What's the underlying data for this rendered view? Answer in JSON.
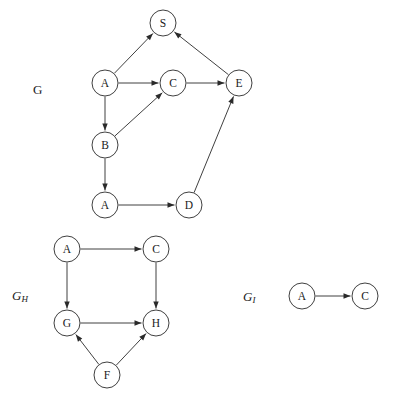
{
  "figure": {
    "type": "directed-graph-collection",
    "background_color": "#ffffff",
    "stroke_color": "#2a2a2a",
    "node_fill": "#ffffff",
    "node_radius": 13
  },
  "graphs": [
    {
      "id": "G",
      "label": "G",
      "label_base": "G",
      "label_sub": "",
      "label_pos": {
        "x": 33,
        "y": 82
      },
      "nodes": [
        {
          "id": "S",
          "label": "S",
          "x": 163,
          "y": 23
        },
        {
          "id": "A1",
          "label": "A",
          "x": 105,
          "y": 83
        },
        {
          "id": "C",
          "label": "C",
          "x": 173,
          "y": 83
        },
        {
          "id": "E",
          "label": "E",
          "x": 239,
          "y": 83
        },
        {
          "id": "B",
          "label": "B",
          "x": 105,
          "y": 145
        },
        {
          "id": "A2",
          "label": "A",
          "x": 105,
          "y": 205
        },
        {
          "id": "D",
          "label": "D",
          "x": 189,
          "y": 205
        }
      ],
      "edges": [
        {
          "from": "A1",
          "to": "S",
          "directed": true
        },
        {
          "from": "A1",
          "to": "C",
          "directed": true
        },
        {
          "from": "C",
          "to": "E",
          "directed": true
        },
        {
          "from": "E",
          "to": "S",
          "directed": true
        },
        {
          "from": "A1",
          "to": "B",
          "directed": true
        },
        {
          "from": "B",
          "to": "C",
          "directed": true
        },
        {
          "from": "B",
          "to": "A2",
          "directed": true
        },
        {
          "from": "A2",
          "to": "D",
          "directed": true
        },
        {
          "from": "D",
          "to": "E",
          "directed": true
        }
      ]
    },
    {
      "id": "GH",
      "label": "GH",
      "label_base": "G",
      "label_sub": "H",
      "label_pos": {
        "x": 12,
        "y": 288
      },
      "nodes": [
        {
          "id": "A",
          "label": "A",
          "x": 67,
          "y": 249
        },
        {
          "id": "C",
          "label": "C",
          "x": 156,
          "y": 249
        },
        {
          "id": "G",
          "label": "G",
          "x": 67,
          "y": 323
        },
        {
          "id": "H",
          "label": "H",
          "x": 156,
          "y": 323
        },
        {
          "id": "F",
          "label": "F",
          "x": 107,
          "y": 375
        }
      ],
      "edges": [
        {
          "from": "A",
          "to": "C",
          "directed": true
        },
        {
          "from": "A",
          "to": "G",
          "directed": true
        },
        {
          "from": "C",
          "to": "H",
          "directed": true
        },
        {
          "from": "G",
          "to": "H",
          "directed": true
        },
        {
          "from": "F",
          "to": "G",
          "directed": true
        },
        {
          "from": "F",
          "to": "H",
          "directed": true
        }
      ]
    },
    {
      "id": "GI",
      "label": "GI",
      "label_base": "G",
      "label_sub": "I",
      "label_pos": {
        "x": 243,
        "y": 289
      },
      "nodes": [
        {
          "id": "A",
          "label": "A",
          "x": 302,
          "y": 296
        },
        {
          "id": "C",
          "label": "C",
          "x": 365,
          "y": 296
        }
      ],
      "edges": [
        {
          "from": "A",
          "to": "C",
          "directed": true
        }
      ]
    }
  ]
}
